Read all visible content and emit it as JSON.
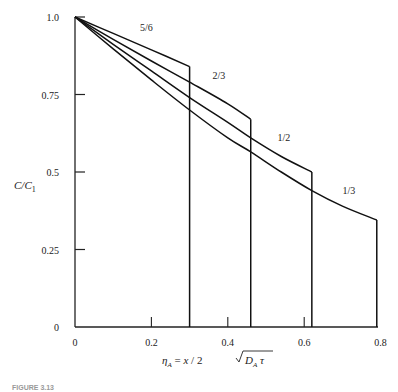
{
  "chart_data": {
    "type": "line",
    "title": "",
    "xlabel": "η_A = x / 2 √(D_A τ)",
    "ylabel": "C/C₁",
    "xlim": [
      0,
      0.8
    ],
    "ylim": [
      0,
      1.0
    ],
    "x_ticks": [
      {
        "value": 0,
        "label": "0"
      },
      {
        "value": 0.2,
        "label": "0.2"
      },
      {
        "value": 0.4,
        "label": "0.4"
      },
      {
        "value": 0.6,
        "label": "0.6"
      },
      {
        "value": 0.8,
        "label": "0.8"
      }
    ],
    "y_ticks": [
      {
        "value": 0,
        "label": "0"
      },
      {
        "value": 0.25,
        "label": "0.25"
      },
      {
        "value": 0.5,
        "label": "0.5"
      },
      {
        "value": 0.75,
        "label": "0.75"
      },
      {
        "value": 1.0,
        "label": "1.0"
      }
    ],
    "grid": false,
    "legend": "inline labels on curves",
    "series": [
      {
        "name": "5/6",
        "label": "5/6",
        "points": [
          [
            0,
            1.0
          ],
          [
            0.1,
            0.947
          ],
          [
            0.2,
            0.894
          ],
          [
            0.3,
            0.84
          ]
        ],
        "end_x": 0.3,
        "drop_to_zero": true
      },
      {
        "name": "2/3",
        "label": "2/3",
        "points": [
          [
            0,
            1.0
          ],
          [
            0.1,
            0.928
          ],
          [
            0.2,
            0.858
          ],
          [
            0.3,
            0.79
          ],
          [
            0.4,
            0.72
          ],
          [
            0.46,
            0.67
          ]
        ],
        "end_x": 0.46,
        "drop_to_zero": true
      },
      {
        "name": "1/2",
        "label": "1/2",
        "points": [
          [
            0,
            1.0
          ],
          [
            0.1,
            0.912
          ],
          [
            0.2,
            0.826
          ],
          [
            0.3,
            0.74
          ],
          [
            0.4,
            0.66
          ],
          [
            0.46,
            0.61
          ],
          [
            0.54,
            0.55
          ],
          [
            0.62,
            0.5
          ]
        ],
        "end_x": 0.62,
        "drop_to_zero": true
      },
      {
        "name": "1/3",
        "label": "1/3",
        "points": [
          [
            0,
            1.0
          ],
          [
            0.1,
            0.897
          ],
          [
            0.2,
            0.797
          ],
          [
            0.3,
            0.7
          ],
          [
            0.4,
            0.61
          ],
          [
            0.46,
            0.565
          ],
          [
            0.54,
            0.5
          ],
          [
            0.62,
            0.44
          ],
          [
            0.7,
            0.39
          ],
          [
            0.79,
            0.345
          ]
        ],
        "end_x": 0.79,
        "drop_to_zero": true
      }
    ]
  },
  "caption": "FIGURE 3.13"
}
